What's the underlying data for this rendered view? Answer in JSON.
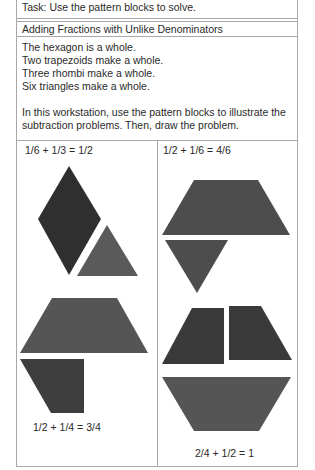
{
  "task": {
    "text": "Task: Use the pattern blocks to solve."
  },
  "section": {
    "title": "Adding Fractions with Unlike Denominators"
  },
  "intro": {
    "lines": [
      "The hexagon is a whole.",
      "Two trapezoids make a whole.",
      "Three rhombi make a whole.",
      "Six triangles make a whole."
    ],
    "instructions": "In this workstation, use the pattern blocks to illustrate the subtraction problems. Then, draw the problem."
  },
  "problems": [
    {
      "equation": "1/6 + 1/3 = 1/2",
      "shapes": [
        "rhombus",
        "triangle"
      ]
    },
    {
      "equation": "1/2 + 1/6 = 4/6",
      "shapes": [
        "trapezoid",
        "triangle"
      ]
    },
    {
      "equation": "1/2 + 1/4 = 3/4",
      "shapes": [
        "trapezoid",
        "half-trapezoid"
      ]
    },
    {
      "equation": "2/4 + 1/2 = 1",
      "shapes": [
        "half-trapezoid",
        "half-trapezoid",
        "trapezoid"
      ]
    }
  ],
  "colors": {
    "rhombus": "#2f2f2f",
    "triangle": "#5a5a5a",
    "trapezoid": "#4d4d4d",
    "half_trapezoid": "#3a3a3a",
    "border": "#a8a8a8"
  }
}
